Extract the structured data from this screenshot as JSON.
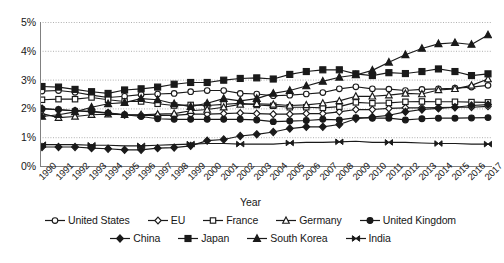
{
  "chart_data": {
    "type": "line",
    "title": "",
    "xlabel": "Year",
    "ylabel": "",
    "ylim": [
      0,
      5
    ],
    "ytick_labels": [
      "0%",
      "1%",
      "2%",
      "3%",
      "4%",
      "5%"
    ],
    "ytick_values": [
      0,
      1,
      2,
      3,
      4,
      5
    ],
    "grid": true,
    "legend_position": "bottom",
    "x": [
      1990,
      1991,
      1992,
      1993,
      1994,
      1995,
      1996,
      1997,
      1998,
      1999,
      2000,
      2001,
      2002,
      2003,
      2004,
      2005,
      2006,
      2007,
      2008,
      2009,
      2010,
      2011,
      2012,
      2013,
      2014,
      2015,
      2016,
      2017
    ],
    "series": [
      {
        "name": "United States",
        "marker": "open-circle",
        "values": [
          2.6,
          2.62,
          2.56,
          2.46,
          2.38,
          2.42,
          2.48,
          2.5,
          2.52,
          2.58,
          2.62,
          2.62,
          2.52,
          2.5,
          2.44,
          2.46,
          2.5,
          2.55,
          2.68,
          2.75,
          2.68,
          2.67,
          2.62,
          2.66,
          2.68,
          2.7,
          2.74,
          2.8
        ]
      },
      {
        "name": "EU",
        "marker": "open-diamond",
        "values": [
          2.0,
          1.95,
          1.92,
          1.9,
          1.85,
          1.78,
          1.76,
          1.76,
          1.76,
          1.8,
          1.8,
          1.82,
          1.84,
          1.82,
          1.8,
          1.8,
          1.82,
          1.82,
          1.88,
          1.96,
          1.96,
          2.0,
          2.02,
          2.02,
          2.03,
          2.04,
          2.04,
          2.07
        ]
      },
      {
        "name": "France",
        "marker": "open-square",
        "values": [
          2.3,
          2.32,
          2.32,
          2.38,
          2.3,
          2.24,
          2.24,
          2.16,
          2.1,
          2.12,
          2.1,
          2.14,
          2.18,
          2.12,
          2.09,
          2.04,
          2.04,
          2.02,
          2.06,
          2.21,
          2.18,
          2.19,
          2.23,
          2.24,
          2.23,
          2.23,
          2.22,
          2.21
        ]
      },
      {
        "name": "Germany",
        "marker": "open-triangle",
        "values": [
          1.82,
          1.68,
          1.72,
          1.78,
          1.8,
          1.78,
          1.78,
          1.8,
          1.82,
          1.92,
          1.96,
          2.04,
          2.14,
          2.16,
          2.14,
          2.1,
          2.12,
          2.18,
          2.26,
          2.42,
          2.42,
          2.46,
          2.52,
          2.5,
          2.64,
          2.68,
          2.8,
          3.02
        ]
      },
      {
        "name": "United Kingdom",
        "marker": "filled-circle",
        "values": [
          1.98,
          1.96,
          1.92,
          1.88,
          1.84,
          1.78,
          1.72,
          1.64,
          1.62,
          1.62,
          1.62,
          1.62,
          1.62,
          1.6,
          1.54,
          1.56,
          1.58,
          1.62,
          1.6,
          1.68,
          1.66,
          1.66,
          1.6,
          1.64,
          1.66,
          1.66,
          1.67,
          1.68
        ]
      },
      {
        "name": "China",
        "marker": "filled-diamond",
        "values": [
          0.66,
          0.66,
          0.66,
          0.62,
          0.6,
          0.56,
          0.56,
          0.62,
          0.64,
          0.7,
          0.88,
          0.92,
          1.04,
          1.1,
          1.18,
          1.3,
          1.36,
          1.36,
          1.44,
          1.64,
          1.7,
          1.76,
          1.88,
          1.96,
          2.0,
          2.04,
          2.1,
          2.13
        ]
      },
      {
        "name": "Japan",
        "marker": "filled-square",
        "values": [
          2.76,
          2.74,
          2.66,
          2.58,
          2.52,
          2.64,
          2.68,
          2.74,
          2.84,
          2.9,
          2.9,
          2.98,
          3.04,
          3.06,
          3.02,
          3.18,
          3.28,
          3.34,
          3.34,
          3.2,
          3.14,
          3.24,
          3.21,
          3.28,
          3.37,
          3.28,
          3.14,
          3.2
        ]
      },
      {
        "name": "South Korea",
        "marker": "filled-triangle",
        "values": [
          1.72,
          1.78,
          1.88,
          2.04,
          2.16,
          2.2,
          2.34,
          2.3,
          2.16,
          2.06,
          2.18,
          2.34,
          2.26,
          2.34,
          2.52,
          2.62,
          2.78,
          2.94,
          3.08,
          3.16,
          3.32,
          3.6,
          3.86,
          4.08,
          4.24,
          4.28,
          4.22,
          4.55
        ]
      },
      {
        "name": "India",
        "marker": "bowtie",
        "values": [
          0.74,
          0.74,
          0.74,
          0.72,
          0.72,
          0.7,
          0.7,
          0.72,
          0.74,
          0.76,
          0.78,
          0.78,
          0.76,
          0.76,
          0.76,
          0.8,
          0.82,
          0.82,
          0.84,
          0.86,
          0.82,
          0.82,
          0.82,
          0.8,
          0.78,
          0.78,
          0.76,
          0.76
        ]
      }
    ]
  },
  "legend": {
    "row1": [
      "United States",
      "EU",
      "France",
      "Germany",
      "United Kingdom"
    ],
    "row2": [
      "China",
      "Japan",
      "South Korea",
      "India"
    ]
  },
  "colors": {
    "line": "#1a1a1a",
    "grid": "#b0b0b0",
    "axis": "#808080",
    "text": "#171717"
  }
}
